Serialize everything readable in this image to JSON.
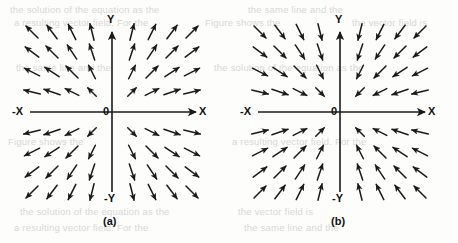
{
  "figure": {
    "background_color": "#fdfdfc",
    "ink_color": "#1a1a1a",
    "ghost_color": "#d8d8d4",
    "ghost_text": {
      "line1": "the solution of the equation as the",
      "line2": "the same line and the",
      "line3": "a resulting vector field. For the",
      "line4": "Figure shows the",
      "line5": "the vector field is"
    }
  },
  "panels": [
    {
      "id": "a",
      "caption": "(a)",
      "field_type": "source",
      "origin": {
        "x": 112,
        "y": 112
      },
      "axes": {
        "y_positive_label": "Y",
        "y_negative_label": "-Y",
        "x_positive_label": "X",
        "x_negative_label": "-X",
        "origin_label": "0"
      }
    },
    {
      "id": "b",
      "caption": "(b)",
      "field_type": "sink",
      "origin": {
        "x": 111,
        "y": 112
      },
      "axes": {
        "y_positive_label": "Y",
        "y_negative_label": "-Y",
        "x_positive_label": "X",
        "x_negative_label": "-X",
        "origin_label": "0"
      }
    }
  ],
  "chart_data": {
    "type": "scatter",
    "title": "",
    "xlabel": "X",
    "ylabel": "Y",
    "grid": false,
    "legend": "none",
    "xlim": [
      -4.5,
      4.5
    ],
    "ylim": [
      -4.5,
      4.5
    ],
    "grid_x": [
      -4,
      -3,
      -2,
      -1,
      1,
      2,
      3,
      4
    ],
    "grid_y": [
      4,
      3,
      2,
      1,
      -1,
      -2,
      -3,
      -4
    ],
    "series": [
      {
        "name": "(a) outward radial field",
        "panel": "a",
        "vector_rule": "u = x/r, v = y/r  (arrows point away from origin)",
        "arrow_spacing_px": 20,
        "arrow_length_px": 17
      },
      {
        "name": "(b) inward radial field",
        "panel": "b",
        "vector_rule": "u = -x/r, v = -y/r  (arrows point toward origin)",
        "arrow_spacing_px": 20,
        "arrow_length_px": 17
      }
    ]
  }
}
